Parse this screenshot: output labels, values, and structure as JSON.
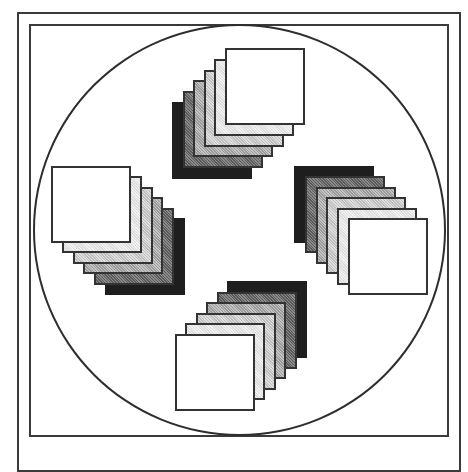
{
  "figure": {
    "outer_frame": {
      "x": 17,
      "y": 12,
      "w": 444,
      "h": 460
    },
    "inner_frame": {
      "x": 29,
      "y": 24,
      "w": 420,
      "h": 413
    },
    "circle": {
      "cx": 239,
      "cy": 230,
      "r": 206
    },
    "square_size": {
      "w": 80,
      "h": 77
    },
    "shades": [
      "white",
      "very-light-gray",
      "light-gray",
      "medium-gray",
      "dark-gray",
      "black"
    ],
    "stacks": [
      {
        "name": "top",
        "back": {
          "x": 172,
          "y": 102
        },
        "front": {
          "x": 225,
          "y": 48
        }
      },
      {
        "name": "left",
        "back": {
          "x": 105,
          "y": 218
        },
        "front": {
          "x": 51,
          "y": 166
        }
      },
      {
        "name": "right",
        "back": {
          "x": 294,
          "y": 166
        },
        "front": {
          "x": 348,
          "y": 218
        }
      },
      {
        "name": "bottom",
        "back": {
          "x": 227,
          "y": 281
        },
        "front": {
          "x": 175,
          "y": 334
        }
      }
    ]
  }
}
